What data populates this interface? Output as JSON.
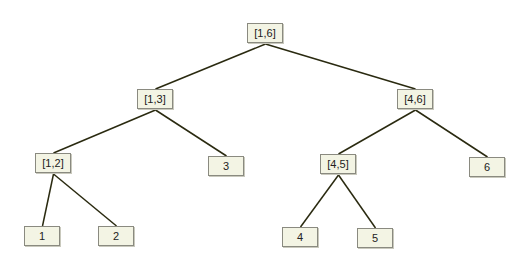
{
  "diagram": {
    "type": "segment-tree",
    "colors": {
      "node_fill": "#f3f4e4",
      "node_border": "#8a8a80",
      "edge": "#2a2a10",
      "background": "#ffffff"
    },
    "nodes": [
      {
        "id": "n16",
        "label": "[1,6]",
        "x": 247,
        "y": 23
      },
      {
        "id": "n13",
        "label": "[1,3]",
        "x": 137,
        "y": 89
      },
      {
        "id": "n46",
        "label": "[4,6]",
        "x": 397,
        "y": 89
      },
      {
        "id": "n12",
        "label": "[1,2]",
        "x": 35,
        "y": 153
      },
      {
        "id": "n3",
        "label": "3",
        "x": 208,
        "y": 156
      },
      {
        "id": "n45",
        "label": "[4,5]",
        "x": 320,
        "y": 154
      },
      {
        "id": "n6",
        "label": "6",
        "x": 469,
        "y": 157
      },
      {
        "id": "n1",
        "label": "1",
        "x": 24,
        "y": 226
      },
      {
        "id": "n2",
        "label": "2",
        "x": 98,
        "y": 226
      },
      {
        "id": "n4",
        "label": "4",
        "x": 282,
        "y": 227
      },
      {
        "id": "n5",
        "label": "5",
        "x": 357,
        "y": 228
      }
    ],
    "edges": [
      [
        "n16",
        "n13"
      ],
      [
        "n16",
        "n46"
      ],
      [
        "n13",
        "n12"
      ],
      [
        "n13",
        "n3"
      ],
      [
        "n46",
        "n45"
      ],
      [
        "n46",
        "n6"
      ],
      [
        "n12",
        "n1"
      ],
      [
        "n12",
        "n2"
      ],
      [
        "n45",
        "n4"
      ],
      [
        "n45",
        "n5"
      ]
    ]
  }
}
